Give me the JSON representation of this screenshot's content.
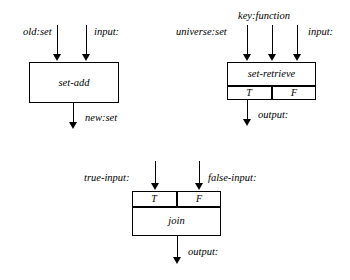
{
  "diagram": {
    "stroke_color": "#000000",
    "background_color": "#ffffff",
    "blocks": [
      {
        "id": "set-add",
        "name": "set-add",
        "label": "set-add",
        "inputs": [
          {
            "label": "old:set"
          },
          {
            "label": "input:"
          }
        ],
        "outputs": [
          {
            "label": "new:set"
          }
        ],
        "ports": []
      },
      {
        "id": "set-retrieve",
        "name": "set-retrieve",
        "label": "set-retrieve",
        "inputs": [
          {
            "label": "universe:set"
          },
          {
            "label": "key:function"
          },
          {
            "label": "input:"
          }
        ],
        "outputs": [
          {
            "label": "output:"
          }
        ],
        "ports": [
          {
            "label": "T"
          },
          {
            "label": "F"
          }
        ]
      },
      {
        "id": "join",
        "name": "join",
        "label": "join",
        "inputs": [
          {
            "label": "true-input:"
          },
          {
            "label": "false-input:"
          }
        ],
        "outputs": [
          {
            "label": "output:"
          }
        ],
        "ports": [
          {
            "label": "T"
          },
          {
            "label": "F"
          }
        ]
      }
    ]
  }
}
